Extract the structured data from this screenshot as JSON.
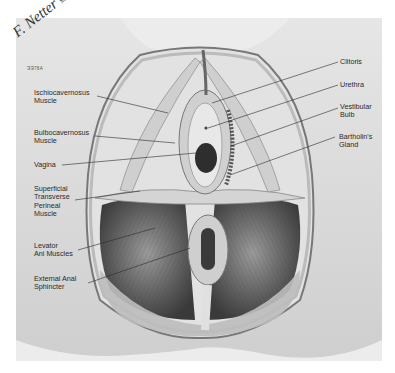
{
  "figure": {
    "signature": "F. Netter",
    "signature_suffix": "M.D.",
    "plate_code": "ЭЭ78А",
    "colors": {
      "background": "#ffffff",
      "plate": "#ececec",
      "muscle_dark": "#4a4a4a",
      "muscle_mid": "#8a8a8a",
      "skin": "#d8d8d8",
      "leader_line": "#2a2a2a"
    }
  },
  "labels": {
    "left": [
      {
        "id": "ischiocavernosus",
        "text": "Ischiocavernosus\nMuscle"
      },
      {
        "id": "bulbocavernosus",
        "text": "Bulbocavernosus\nMuscle"
      },
      {
        "id": "vagina",
        "text": "Vagina"
      },
      {
        "id": "superficial-transverse-perineal",
        "text": "Superficial\nTransverse\nPerineal\nMuscle"
      },
      {
        "id": "levator-ani",
        "text": "Levator\nAni Muscles"
      },
      {
        "id": "external-anal-sphincter",
        "text": "External Anal\nSphincter"
      }
    ],
    "right": [
      {
        "id": "clitoris",
        "text": "Clitoris"
      },
      {
        "id": "urethra",
        "text": "Urethra"
      },
      {
        "id": "vestibular-bulb",
        "text": "Vestibular\nBulb"
      },
      {
        "id": "bartholins-gland",
        "text": "Bartholin's\nGland"
      }
    ]
  }
}
